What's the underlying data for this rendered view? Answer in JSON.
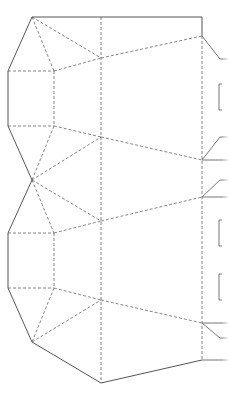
{
  "diagram": {
    "type": "papercraft-template",
    "colors": {
      "background": "#ffffff",
      "cut_line": "#555555",
      "fold_line": "#666666"
    },
    "legend": {
      "solid": "cut line",
      "dashed": "fold line"
    },
    "cut_path": [
      [
        202,
        36
      ],
      [
        202,
        17
      ],
      [
        32,
        17
      ],
      [
        8,
        71
      ],
      [
        8,
        126
      ],
      [
        32,
        180
      ],
      [
        8,
        233
      ],
      [
        8,
        288
      ],
      [
        32,
        342
      ],
      [
        101,
        383
      ],
      [
        202,
        360
      ]
    ],
    "fold_lines": [
      [
        [
          101,
          17
        ],
        [
          101,
          383
        ]
      ],
      [
        [
          202,
          36
        ],
        [
          202,
          360
        ]
      ],
      [
        [
          8,
          71
        ],
        [
          54,
          71
        ]
      ],
      [
        [
          8,
          126
        ],
        [
          54,
          126
        ]
      ],
      [
        [
          54,
          71
        ],
        [
          54,
          126
        ]
      ],
      [
        [
          32,
          17
        ],
        [
          54,
          71
        ]
      ],
      [
        [
          32,
          17
        ],
        [
          101,
          58
        ]
      ],
      [
        [
          54,
          71
        ],
        [
          101,
          58
        ]
      ],
      [
        [
          101,
          58
        ],
        [
          202,
          36
        ]
      ],
      [
        [
          54,
          126
        ],
        [
          101,
          137
        ]
      ],
      [
        [
          101,
          137
        ],
        [
          202,
          160
        ]
      ],
      [
        [
          54,
          126
        ],
        [
          32,
          180
        ]
      ],
      [
        [
          32,
          180
        ],
        [
          101,
          137
        ]
      ],
      [
        [
          32,
          180
        ],
        [
          101,
          221
        ]
      ],
      [
        [
          32,
          180
        ],
        [
          54,
          233
        ]
      ],
      [
        [
          101,
          221
        ],
        [
          202,
          197
        ]
      ],
      [
        [
          54,
          233
        ],
        [
          101,
          221
        ]
      ],
      [
        [
          8,
          233
        ],
        [
          54,
          233
        ]
      ],
      [
        [
          54,
          233
        ],
        [
          54,
          288
        ]
      ],
      [
        [
          8,
          288
        ],
        [
          54,
          288
        ]
      ],
      [
        [
          54,
          288
        ],
        [
          101,
          300
        ]
      ],
      [
        [
          101,
          300
        ],
        [
          202,
          323
        ]
      ],
      [
        [
          54,
          288
        ],
        [
          32,
          342
        ]
      ],
      [
        [
          32,
          342
        ],
        [
          101,
          300
        ]
      ]
    ],
    "tabs": [
      {
        "points": [
          [
            202,
            36
          ],
          [
            220,
            59
          ],
          [
            229,
            59
          ]
        ]
      },
      {
        "points": [
          [
            222,
            84
          ],
          [
            219,
            84
          ],
          [
            219,
            110
          ],
          [
            222,
            110
          ]
        ]
      },
      {
        "points": [
          [
            229,
            137
          ],
          [
            220,
            137
          ],
          [
            202,
            160
          ],
          [
            229,
            160
          ]
        ]
      },
      {
        "points": [
          [
            229,
            180
          ],
          [
            220,
            180
          ],
          [
            202,
            197
          ],
          [
            229,
            197
          ]
        ]
      },
      {
        "points": [
          [
            222,
            220
          ],
          [
            219,
            220
          ],
          [
            219,
            246
          ],
          [
            222,
            246
          ]
        ]
      },
      {
        "points": [
          [
            222,
            274
          ],
          [
            219,
            274
          ],
          [
            219,
            300
          ],
          [
            222,
            300
          ]
        ]
      },
      {
        "points": [
          [
            229,
            323
          ],
          [
            220,
            323
          ],
          [
            202,
            323
          ]
        ]
      },
      {
        "points": [
          [
            202,
            323
          ],
          [
            220,
            338
          ],
          [
            229,
            338
          ]
        ]
      },
      {
        "points": [
          [
            202,
            360
          ],
          [
            229,
            360
          ]
        ]
      }
    ]
  }
}
